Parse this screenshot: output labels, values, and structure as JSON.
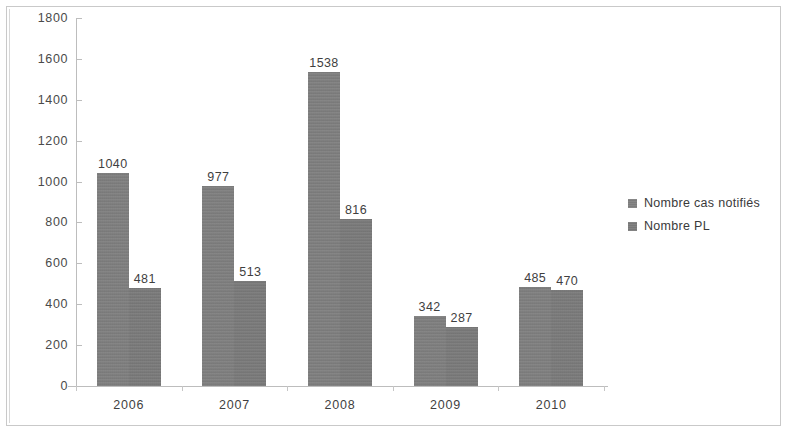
{
  "chart_data": {
    "type": "bar",
    "title": "",
    "subtitle": "",
    "xlabel": "",
    "ylabel": "",
    "categories": [
      "2006",
      "2007",
      "2008",
      "2009",
      "2010"
    ],
    "series": [
      {
        "name": "Nombre cas notifiés",
        "values": [
          1040,
          977,
          1538,
          342,
          485
        ],
        "color": "#7d7d7d"
      },
      {
        "name": "Nombre PL",
        "values": [
          481,
          513,
          816,
          287,
          470
        ],
        "color": "#787878"
      }
    ],
    "ylim": [
      0,
      1800
    ],
    "ytick_labels": [
      "0",
      "200",
      "400",
      "600",
      "800",
      "1000",
      "1200",
      "1400",
      "1600",
      "1800"
    ],
    "ytick_values": [
      0,
      200,
      400,
      600,
      800,
      1000,
      1200,
      1400,
      1600,
      1800
    ],
    "grid": false,
    "data_labels": true,
    "legend_position": "right",
    "legend_entries": [
      "Nombre cas notifiés",
      "Nombre PL"
    ],
    "bar_labels": [
      {
        "category": "2006",
        "series_a": "1040",
        "series_b": "481"
      },
      {
        "category": "2007",
        "series_a": "977",
        "series_b": "513"
      },
      {
        "category": "2008",
        "series_a": "1538",
        "series_b": "816"
      },
      {
        "category": "2009",
        "series_a": "342",
        "series_b": "287"
      },
      {
        "category": "2010",
        "series_a": "485",
        "series_b": "470"
      }
    ]
  },
  "legend": {
    "items": [
      {
        "label": "Nombre cas notifiés"
      },
      {
        "label": "Nombre PL"
      }
    ]
  }
}
